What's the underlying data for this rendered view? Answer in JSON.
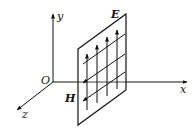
{
  "diagram": {
    "axes": {
      "x_label": "x",
      "y_label": "y",
      "z_label": "z",
      "origin_label": "O"
    },
    "field_labels": {
      "electric": "E",
      "magnetic": "H"
    },
    "colors": {
      "stroke": "#111111",
      "background": "#ffffff"
    }
  }
}
